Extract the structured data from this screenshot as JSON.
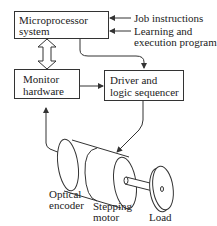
{
  "diagram": {
    "blocks": {
      "microprocessor": {
        "line1": "Microprocessor",
        "line2": "system"
      },
      "monitor": {
        "line1": "Monitor",
        "line2": "hardware"
      },
      "driver": {
        "line1": "Driver and",
        "line2": "logic sequencer"
      }
    },
    "inputs": {
      "job": "Job instructions",
      "learning_line1": "Learning and",
      "learning_line2": "execution program"
    },
    "components": {
      "encoder_line1": "Optical",
      "encoder_line2": "encoder",
      "motor_line1": "Stepping",
      "motor_line2": "motor",
      "load": "Load"
    },
    "colors": {
      "line": "#333333",
      "background": "#ffffff"
    }
  }
}
